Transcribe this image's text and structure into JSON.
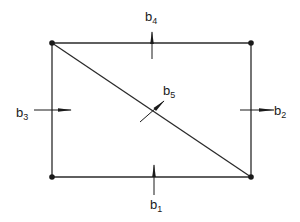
{
  "diagram": {
    "type": "structural-frame-with-diagonal",
    "stroke_color": "#2a2a2a",
    "nodes": [
      {
        "id": "top-left",
        "x": 52,
        "y": 43
      },
      {
        "id": "top-right",
        "x": 251,
        "y": 43
      },
      {
        "id": "bottom-left",
        "x": 52,
        "y": 177
      },
      {
        "id": "bottom-right",
        "x": 251,
        "y": 177
      }
    ],
    "members": [
      {
        "id": "top",
        "from": "top-left",
        "to": "top-right"
      },
      {
        "id": "right",
        "from": "top-right",
        "to": "bottom-right"
      },
      {
        "id": "bottom",
        "from": "bottom-left",
        "to": "bottom-right"
      },
      {
        "id": "left",
        "from": "top-left",
        "to": "bottom-left"
      },
      {
        "id": "diagonal",
        "from": "top-left",
        "to": "bottom-right"
      }
    ],
    "labels": {
      "b1": {
        "base": "b",
        "sub": "1"
      },
      "b2": {
        "base": "b",
        "sub": "2"
      },
      "b3": {
        "base": "b",
        "sub": "3"
      },
      "b4": {
        "base": "b",
        "sub": "4"
      },
      "b5": {
        "base": "b",
        "sub": "5"
      }
    }
  }
}
